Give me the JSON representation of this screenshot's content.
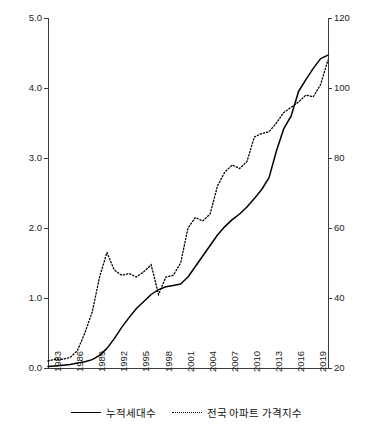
{
  "chart_data": {
    "type": "line",
    "title": "",
    "xlabel": "",
    "ylabel": "",
    "y2label": "",
    "grid": false,
    "legend_position": "bottom",
    "x_tick_labels": [
      "1983",
      "1986",
      "1989",
      "1992",
      "1995",
      "1998",
      "2001",
      "2004",
      "2007",
      "2010",
      "2013",
      "2016",
      "2019"
    ],
    "xlim": [
      1983,
      2021
    ],
    "y_left_ticks": [
      "0.0",
      "1.0",
      "2.0",
      "3.0",
      "4.0",
      "5.0"
    ],
    "ylim": [
      0,
      5
    ],
    "y_right_ticks": [
      "20",
      "40",
      "60",
      "80",
      "100",
      "120"
    ],
    "y2lim": [
      20,
      120
    ],
    "series": [
      {
        "name": "누적세대수",
        "axis": "left",
        "style": "solid",
        "x": [
          1983,
          1984,
          1985,
          1986,
          1987,
          1988,
          1989,
          1990,
          1991,
          1992,
          1993,
          1994,
          1995,
          1996,
          1997,
          1998,
          1999,
          2000,
          2001,
          2002,
          2003,
          2004,
          2005,
          2006,
          2007,
          2008,
          2009,
          2010,
          2011,
          2012,
          2013,
          2014,
          2015,
          2016,
          2017,
          2018,
          2019,
          2020,
          2021
        ],
        "values": [
          0.02,
          0.03,
          0.04,
          0.05,
          0.07,
          0.09,
          0.12,
          0.18,
          0.28,
          0.42,
          0.58,
          0.72,
          0.85,
          0.95,
          1.05,
          1.12,
          1.16,
          1.18,
          1.2,
          1.3,
          1.45,
          1.6,
          1.75,
          1.9,
          2.02,
          2.12,
          2.2,
          2.3,
          2.42,
          2.55,
          2.72,
          3.1,
          3.42,
          3.6,
          3.95,
          4.12,
          4.28,
          4.42,
          4.47
        ]
      },
      {
        "name": "전국 아파트 가격지수",
        "axis": "right",
        "style": "dotted",
        "x": [
          1983,
          1984,
          1985,
          1986,
          1987,
          1988,
          1989,
          1990,
          1991,
          1992,
          1993,
          1994,
          1995,
          1996,
          1997,
          1998,
          1999,
          2000,
          2001,
          2002,
          2003,
          2004,
          2005,
          2006,
          2007,
          2008,
          2009,
          2010,
          2011,
          2012,
          2013,
          2014,
          2015,
          2016,
          2017,
          2018,
          2019,
          2020,
          2021
        ],
        "values": [
          22.0,
          22.5,
          22.5,
          23.0,
          25.0,
          30.0,
          36.0,
          46.0,
          53.0,
          48.0,
          46.5,
          47.0,
          46.0,
          47.5,
          49.5,
          41.0,
          46.0,
          46.5,
          50.0,
          60.0,
          63.0,
          62.0,
          64.0,
          72.0,
          76.0,
          78.0,
          77.0,
          79.0,
          86.0,
          87.0,
          87.5,
          90.0,
          93.0,
          94.5,
          96.0,
          98.0,
          97.5,
          101.0,
          108.0
        ]
      }
    ]
  },
  "legend": {
    "items": [
      {
        "label": "누적세대수",
        "style": "solid"
      },
      {
        "label": "전국 아파트 가격지수",
        "style": "dotted"
      }
    ]
  }
}
